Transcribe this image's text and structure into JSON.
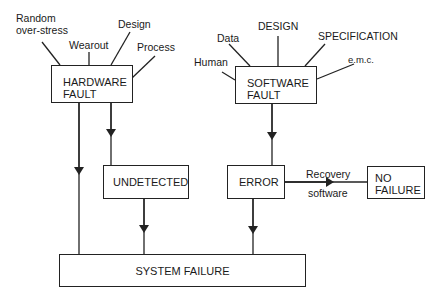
{
  "diagram": {
    "hardware_fault": {
      "line1": "HARDWARE",
      "line2": "FAULT",
      "causes": {
        "random_line1": "Random",
        "random_line2": "over-stress",
        "wearout": "Wearout",
        "design": "Design",
        "process": "Process"
      }
    },
    "software_fault": {
      "line1": "SOFTWARE",
      "line2": "FAULT",
      "causes": {
        "human": "Human",
        "data": "Data",
        "design": "DESIGN",
        "specification": "SPECIFICATION",
        "emc": "e.m.c."
      }
    },
    "undetected": "UNDETECTED",
    "error": "ERROR",
    "recovery_top": "Recovery",
    "recovery_bottom": "software",
    "no_failure": {
      "line1": "NO",
      "line2": "FAILURE"
    },
    "system_failure": "SYSTEM FAILURE",
    "line_color": "#222222"
  }
}
